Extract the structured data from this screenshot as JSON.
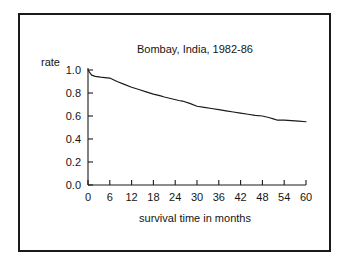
{
  "chart_data": {
    "type": "line",
    "title": "Bombay, India, 1982-86",
    "xlabel": "survival time in months",
    "ylabel": "rate",
    "xlim": [
      0,
      60
    ],
    "ylim": [
      0.0,
      1.0
    ],
    "grid": false,
    "legend": null,
    "xticks": [
      0,
      6,
      12,
      18,
      24,
      30,
      36,
      42,
      48,
      54,
      60
    ],
    "xtick_labels": [
      "0",
      "6",
      "12",
      "18",
      "24",
      "30",
      "36",
      "42",
      "48",
      "54",
      "60"
    ],
    "yticks": [
      0.0,
      0.2,
      0.4,
      0.6,
      0.8,
      1.0
    ],
    "ytick_labels": [
      "0.0",
      "0.2",
      "0.4",
      "0.6",
      "0.8",
      "1.0"
    ],
    "series": [
      {
        "name": "survival rate",
        "x": [
          0,
          1,
          2,
          3,
          4,
          6,
          8,
          10,
          12,
          14,
          16,
          18,
          20,
          21,
          23,
          25,
          26,
          28,
          30,
          32,
          34,
          36,
          38,
          40,
          42,
          44,
          46,
          48,
          50,
          51,
          52,
          54,
          56,
          58,
          60
        ],
        "values": [
          1.0,
          0.955,
          0.945,
          0.94,
          0.935,
          0.93,
          0.9,
          0.875,
          0.85,
          0.83,
          0.81,
          0.79,
          0.775,
          0.765,
          0.75,
          0.735,
          0.73,
          0.71,
          0.685,
          0.675,
          0.665,
          0.655,
          0.645,
          0.635,
          0.625,
          0.615,
          0.605,
          0.6,
          0.585,
          0.575,
          0.565,
          0.565,
          0.56,
          0.555,
          0.55
        ]
      }
    ]
  },
  "figure": {
    "title_text": "Bombay, India, 1982-86",
    "y_axis_name": "rate",
    "x_axis_name": "survival time in months"
  },
  "colors": {
    "line": "#1a1a1a",
    "axis": "#1a1a1a",
    "text": "#141414",
    "background": "#ffffff",
    "border": "#1a1a1a"
  }
}
